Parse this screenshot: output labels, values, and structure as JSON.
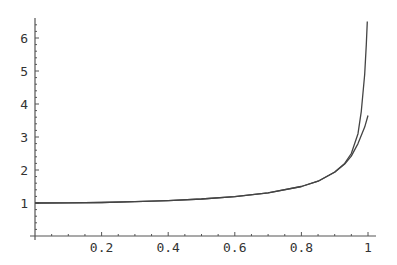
{
  "chart_data": {
    "type": "line",
    "title": "",
    "xlabel": "",
    "ylabel": "",
    "xlim": [
      0,
      1
    ],
    "ylim": [
      0,
      6.5
    ],
    "grid": false,
    "legend": null,
    "x_ticks": [
      "0.2",
      "0.4",
      "0.6",
      "0.8",
      "1"
    ],
    "y_ticks": [
      "1",
      "2",
      "3",
      "4",
      "5",
      "6"
    ],
    "series": [
      {
        "name": "function",
        "color": "#444444",
        "x": [
          0,
          0.1,
          0.2,
          0.3,
          0.4,
          0.5,
          0.6,
          0.7,
          0.8,
          0.85,
          0.9,
          0.93,
          0.95,
          0.97,
          0.98,
          0.99,
          0.995,
          0.998
        ],
        "y": [
          1,
          1.004,
          1.016,
          1.038,
          1.072,
          1.122,
          1.195,
          1.31,
          1.5,
          1.66,
          1.94,
          2.2,
          2.5,
          3.1,
          3.78,
          4.9,
          5.8,
          6.5
        ]
      },
      {
        "name": "approximation",
        "color": "#444444",
        "x": [
          0,
          0.1,
          0.2,
          0.3,
          0.4,
          0.5,
          0.6,
          0.7,
          0.8,
          0.85,
          0.9,
          0.93,
          0.95,
          0.97,
          0.99,
          1.0
        ],
        "y": [
          1,
          1.004,
          1.016,
          1.038,
          1.072,
          1.122,
          1.195,
          1.31,
          1.5,
          1.66,
          1.93,
          2.18,
          2.42,
          2.8,
          3.3,
          3.65
        ]
      }
    ]
  }
}
